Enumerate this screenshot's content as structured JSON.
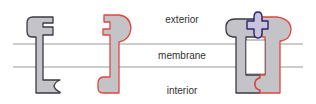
{
  "labels": {
    "exterior": "exterior",
    "membrane": "membrane",
    "interior": "interior"
  },
  "colors": {
    "shape_fill": "#c4c4c8",
    "left_outline": "#3a3a44",
    "right_outline": "#e0463e",
    "plus_outline": "#2a2370",
    "plus_fill": "#c8c4dc",
    "membrane_line": "#9a9a9a",
    "text": "#333333"
  },
  "shapes": [
    {
      "name": "left-protein",
      "outline": "dark"
    },
    {
      "name": "right-protein",
      "outline": "red"
    },
    {
      "name": "assembled-complex",
      "parts": [
        "left-protein",
        "right-protein",
        "plus-connector"
      ]
    }
  ]
}
